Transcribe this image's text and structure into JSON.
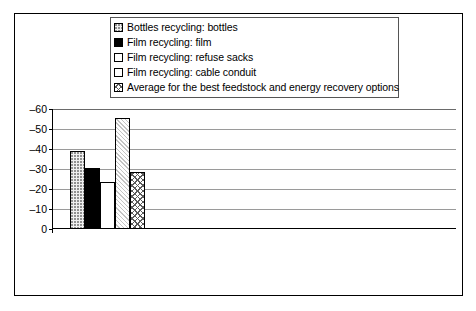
{
  "legend": {
    "items": [
      {
        "label": "Bottles recycling: bottles",
        "swatch": "fine-dotted-pattern"
      },
      {
        "label": "Film recycling: film",
        "swatch": "solid-black"
      },
      {
        "label": "Film recycling: refuse sacks",
        "swatch": "white-empty"
      },
      {
        "label": "Film recycling: cable conduit",
        "swatch": "light-gray-diagonal"
      },
      {
        "label": "Average for the best feedstock and energy recovery options",
        "swatch": "crosshatch"
      }
    ]
  },
  "axis": {
    "y_ticks": [
      "–60",
      "–50",
      "–40",
      "–30",
      "–20",
      "–10",
      "0"
    ],
    "y_tick_values": [
      -60,
      -50,
      -40,
      -30,
      -20,
      -10,
      0
    ]
  },
  "categories": [
    {
      "name": "Energy use",
      "unit": "(MJ/kg)"
    },
    {
      "name": "Global warming potential",
      "unit": "(kg CO₂/kg)(× 0.1)"
    },
    {
      "name": "Acidification",
      "unit": "(g SO₄/kg)"
    },
    {
      "name": "Eutrophication",
      "unit": "(g PO₄/kg)"
    }
  ],
  "chart_data": {
    "type": "bar",
    "title": "",
    "xlabel": "",
    "ylabel": "",
    "ylim": [
      0,
      -60
    ],
    "y_inverted": true,
    "grid": true,
    "legend_position": "top-center",
    "categories": [
      "Energy use (MJ/kg)",
      "Global warming potential (kg CO2/kg)(x 0.1)",
      "Acidification (g SO4/kg)",
      "Eutrophication (g PO4/kg)"
    ],
    "series": [
      {
        "name": "Bottles recycling: bottles",
        "values": [
          -38.5,
          -5,
          -33.5,
          -15
        ]
      },
      {
        "name": "Film recycling: film",
        "values": [
          -30,
          -6,
          -35,
          -15
        ]
      },
      {
        "name": "Film recycling: refuse sacks",
        "values": [
          -23,
          -3,
          -19,
          -11
        ]
      },
      {
        "name": "Film recycling: cable conduit",
        "values": [
          -55,
          -10,
          -44,
          -21
        ]
      },
      {
        "name": "Average for the best feedstock and energy recovery options",
        "values": [
          -28,
          -2.5,
          -21,
          -8.5
        ]
      }
    ]
  }
}
